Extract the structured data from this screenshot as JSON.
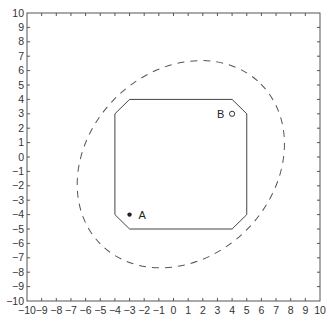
{
  "chart_data": {
    "type": "scatter",
    "title": "",
    "xlabel": "",
    "ylabel": "",
    "xlim": [
      -10,
      10
    ],
    "ylim": [
      -10,
      10
    ],
    "grid": false,
    "x_ticks": [
      "-10",
      "-9",
      "-8",
      "-7",
      "-6",
      "-5",
      "-4",
      "-3",
      "-2",
      "-1",
      "0",
      "1",
      "2",
      "3",
      "4",
      "5",
      "6",
      "7",
      "8",
      "9",
      "10"
    ],
    "y_ticks": [
      "10",
      "9",
      "8",
      "7",
      "6",
      "5",
      "4",
      "3",
      "2",
      "1",
      "0",
      "-1",
      "-2",
      "-3",
      "-4",
      "-5",
      "-6",
      "-7",
      "-8",
      "-9",
      "-10"
    ],
    "points": [
      {
        "label": "A",
        "x": -3,
        "y": -4,
        "marker": "asterisk"
      },
      {
        "label": "B",
        "x": 4,
        "y": 3,
        "marker": "circle"
      }
    ],
    "shapes": [
      {
        "name": "octagon",
        "style": "solid",
        "vertices": [
          [
            -3,
            4
          ],
          [
            4,
            4
          ],
          [
            5,
            3
          ],
          [
            5,
            -4
          ],
          [
            4,
            -5
          ],
          [
            -3,
            -5
          ],
          [
            -4,
            -4
          ],
          [
            -4,
            3
          ]
        ]
      },
      {
        "name": "ellipse",
        "style": "dashed",
        "center": [
          0.5,
          -0.5
        ],
        "semi_major": 7.8,
        "semi_minor": 6.4,
        "rotation_deg": 45
      }
    ]
  },
  "labels": {
    "point_a": "A",
    "point_b": "B"
  },
  "colors": {
    "axis": "#555555",
    "shape": "#444444",
    "ellipse": "#555555"
  }
}
